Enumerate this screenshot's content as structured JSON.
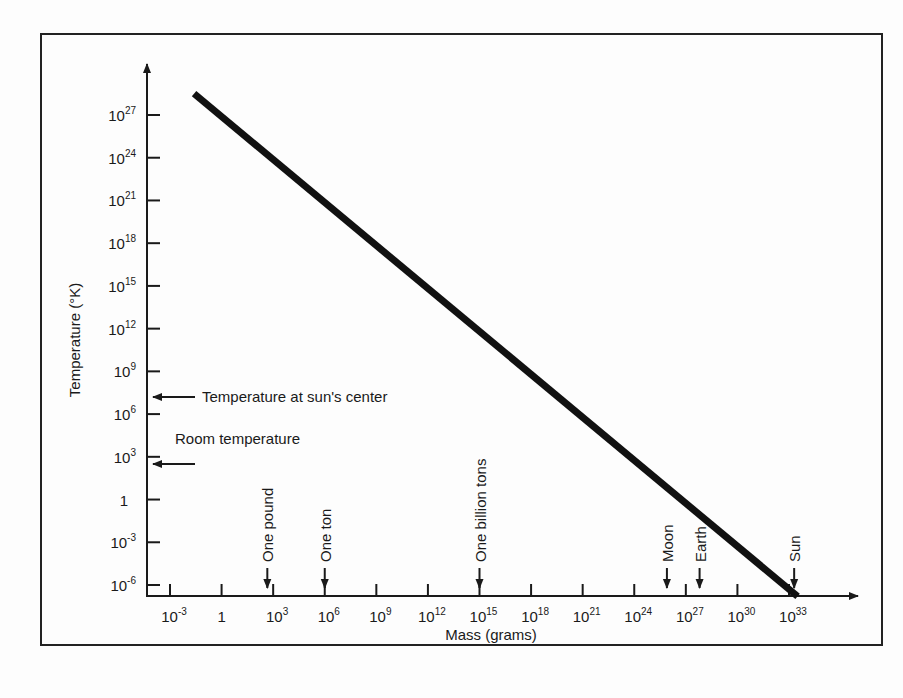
{
  "chart_data": {
    "type": "line",
    "title": "",
    "xlabel": "Mass (grams)",
    "ylabel": "Temperature (°K)",
    "x_scale": "log",
    "y_scale": "log",
    "x_ticks": [
      {
        "exp": -3,
        "label": "10",
        "sup": "-3"
      },
      {
        "exp": 0,
        "label": "1",
        "sup": ""
      },
      {
        "exp": 3,
        "label": "10",
        "sup": "3"
      },
      {
        "exp": 6,
        "label": "10",
        "sup": "6"
      },
      {
        "exp": 9,
        "label": "10",
        "sup": "9"
      },
      {
        "exp": 12,
        "label": "10",
        "sup": "12"
      },
      {
        "exp": 15,
        "label": "10",
        "sup": "15"
      },
      {
        "exp": 18,
        "label": "10",
        "sup": "18"
      },
      {
        "exp": 21,
        "label": "10",
        "sup": "21"
      },
      {
        "exp": 24,
        "label": "10",
        "sup": "24"
      },
      {
        "exp": 27,
        "label": "10",
        "sup": "27"
      },
      {
        "exp": 30,
        "label": "10",
        "sup": "30"
      },
      {
        "exp": 33,
        "label": "10",
        "sup": "33"
      }
    ],
    "y_ticks": [
      {
        "exp": 27,
        "label": "10",
        "sup": "27"
      },
      {
        "exp": 24,
        "label": "10",
        "sup": "24"
      },
      {
        "exp": 21,
        "label": "10",
        "sup": "21"
      },
      {
        "exp": 18,
        "label": "10",
        "sup": "18"
      },
      {
        "exp": 15,
        "label": "10",
        "sup": "15"
      },
      {
        "exp": 12,
        "label": "10",
        "sup": "12"
      },
      {
        "exp": 9,
        "label": "10",
        "sup": "9"
      },
      {
        "exp": 6,
        "label": "10",
        "sup": "6"
      },
      {
        "exp": 3,
        "label": "10",
        "sup": "3"
      },
      {
        "exp": 0,
        "label": "1",
        "sup": ""
      },
      {
        "exp": -3,
        "label": "10",
        "sup": "-3"
      },
      {
        "exp": -6,
        "label": "10",
        "sup": "-6"
      }
    ],
    "xlim_exp": [
      -4.3,
      35.5
    ],
    "ylim_exp": [
      -7,
      30
    ],
    "series": [
      {
        "name": "Temperature vs mass",
        "x_log10": [
          -1.6,
          33.5
        ],
        "y_log10": [
          28.5,
          -6.8
        ],
        "note": "Straight line on log-log axes; slope approximately -1"
      }
    ],
    "x_annotations": [
      {
        "label": "One pound",
        "x_log10": 2.66
      },
      {
        "label": "One ton",
        "x_log10": 6
      },
      {
        "label": "One billion tons",
        "x_log10": 15
      },
      {
        "label": "Moon",
        "x_log10": 25.9
      },
      {
        "label": "Earth",
        "x_log10": 27.8
      },
      {
        "label": "Sun",
        "x_log10": 33.3
      }
    ],
    "y_annotations": [
      {
        "label": "Temperature at sun's center",
        "y_log10": 7.2
      },
      {
        "label": "Room temperature",
        "y_log10": 2.5
      }
    ],
    "grid": false,
    "legend": null
  }
}
